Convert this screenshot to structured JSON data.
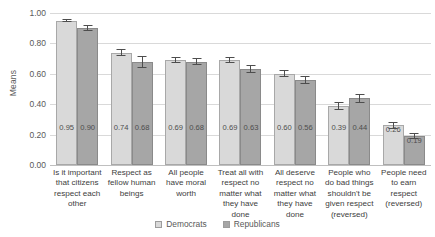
{
  "chart_data": {
    "type": "bar",
    "title": "",
    "xlabel": "",
    "ylabel": "Means",
    "ylim": [
      0,
      1.0
    ],
    "ytick_labels": [
      "1.00",
      "0.80",
      "0.60",
      "0.40",
      "0.20",
      "0.00"
    ],
    "ytick_values": [
      1.0,
      0.8,
      0.6,
      0.4,
      0.2,
      0.0
    ],
    "grid": true,
    "legend_position": "bottom-center",
    "categories": [
      "Is it important that citizens respect each other",
      "Respect as fellow human beings",
      "All people have moral worth",
      "Treat all with respect no matter what they have done",
      "All deserve respect no matter what they have done",
      "People who do bad things shouldn't be given respect (reversed)",
      "People need to earn respect (reversed)"
    ],
    "series": [
      {
        "name": "Democrats",
        "color": "#d9d9d9",
        "values": [
          0.95,
          0.74,
          0.69,
          0.69,
          0.6,
          0.39,
          0.26
        ],
        "labels": [
          "0.95",
          "0.74",
          "0.69",
          "0.69",
          "0.60",
          "0.39",
          "0.26"
        ],
        "errors": [
          0.012,
          0.022,
          0.018,
          0.022,
          0.022,
          0.026,
          0.026
        ]
      },
      {
        "name": "Republicans",
        "color": "#a6a6a6",
        "values": [
          0.9,
          0.68,
          0.68,
          0.63,
          0.56,
          0.44,
          0.19
        ],
        "labels": [
          "0.90",
          "0.68",
          "0.68",
          "0.63",
          "0.56",
          "0.44",
          "0.19"
        ],
        "errors": [
          0.018,
          0.04,
          0.022,
          0.028,
          0.026,
          0.03,
          0.022
        ]
      }
    ]
  }
}
